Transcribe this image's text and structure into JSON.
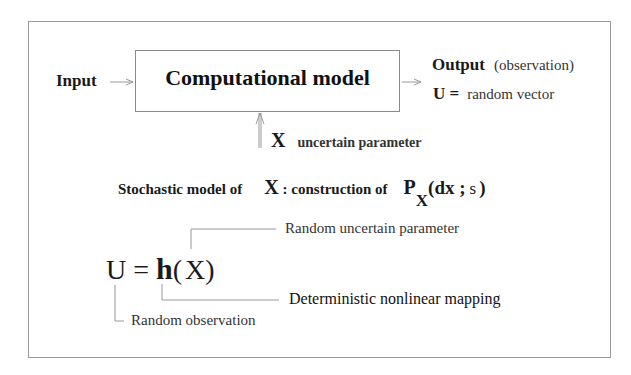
{
  "diagram": {
    "input_label": "Input",
    "model_box_label": "Computational model",
    "output_label": "Output",
    "output_note": "(observation)",
    "output_def_symbol": "U =",
    "output_def_text": "random vector",
    "param_symbol": "X",
    "param_text": "uncertain parameter",
    "stochastic": {
      "prefix": "Stochastic model of",
      "symbol": "X",
      "middle": ": construction of",
      "p": "P",
      "p_sub": "X",
      "args_open": "(dx ;",
      "args_s": "s",
      "args_close": ")"
    },
    "equation": {
      "lhs": "U",
      "eq": "=",
      "func": "h",
      "open": "(",
      "arg": "X",
      "close": ")"
    },
    "annotations": {
      "random_uncertain_parameter": "Random uncertain parameter",
      "deterministic_mapping": "Deterministic nonlinear mapping",
      "random_observation": "Random observation"
    },
    "colors": {
      "frame": "#9a9a9a",
      "lines": "#999999",
      "text": "#1a1a1a"
    }
  }
}
